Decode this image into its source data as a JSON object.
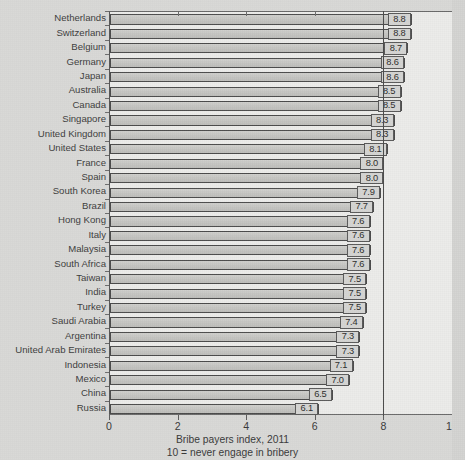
{
  "chart_data": {
    "type": "bar",
    "orientation": "horizontal",
    "title": "",
    "caption_line1": "Bribe payers index, 2011",
    "caption_line2": "10 = never engage in bribery",
    "xlabel": "",
    "ylabel": "",
    "xlim": [
      0,
      10
    ],
    "xticks": [
      "0",
      "2",
      "4",
      "6",
      "8",
      "10"
    ],
    "xtick_values": [
      0,
      2,
      4,
      6,
      8,
      10
    ],
    "grid": false,
    "reference_line": 8,
    "legend": null,
    "categories": [
      "Netherlands",
      "Switzerland",
      "Belgium",
      "Germany",
      "Japan",
      "Australia",
      "Canada",
      "Singapore",
      "United Kingdom",
      "United States",
      "France",
      "Spain",
      "South Korea",
      "Brazil",
      "Hong Kong",
      "Italy",
      "Malaysia",
      "South Africa",
      "Taiwan",
      "India",
      "Turkey",
      "Saudi Arabia",
      "Argentina",
      "United Arab Emirates",
      "Indonesia",
      "Mexico",
      "China",
      "Russia"
    ],
    "values": [
      8.8,
      8.8,
      8.7,
      8.6,
      8.6,
      8.5,
      8.5,
      8.3,
      8.3,
      8.1,
      8.0,
      8.0,
      7.9,
      7.7,
      7.6,
      7.6,
      7.6,
      7.6,
      7.5,
      7.5,
      7.5,
      7.4,
      7.3,
      7.3,
      7.1,
      7.0,
      6.5,
      6.1
    ],
    "value_labels": [
      "8.8",
      "8.8",
      "8.7",
      "8.6",
      "8.6",
      "8.5",
      "8.5",
      "8.3",
      "8.3",
      "8.1",
      "8.0",
      "8.0",
      "7.9",
      "7.7",
      "7.6",
      "7.6",
      "7.6",
      "7.6",
      "7.5",
      "7.5",
      "7.5",
      "7.4",
      "7.3",
      "7.3",
      "7.1",
      "7.0",
      "6.5",
      "6.1"
    ],
    "colors": {
      "bar_fill": "#c6c6c3",
      "bar_border": "#4c4c4c",
      "plot_background": "#ececea",
      "page_background": "#d9d9d7",
      "text": "#3a3a3a",
      "reference_line": "#4a4a4a"
    }
  }
}
